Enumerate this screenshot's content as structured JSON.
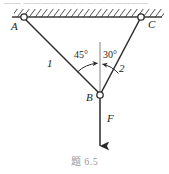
{
  "figure": {
    "caption": "题 6.5",
    "bleed_text": "一一 一一一一一一一一一一一一一一",
    "points": {
      "a_label": "A",
      "b_label": "B",
      "c_label": "C"
    },
    "rods": {
      "rod1_label": "1",
      "rod2_label": "2"
    },
    "angles": {
      "left_label": "45°",
      "right_label": "30°"
    },
    "force": {
      "label": "F"
    },
    "colors": {
      "line": "#2a2a2a",
      "ceiling": "#3a3a3a",
      "reference_line": "#8d8d8d",
      "arc": "#3a3a3a",
      "text": "#1c1c1c",
      "caption_text": "#9a9a9a",
      "background": "#ffffff"
    },
    "geometry": {
      "ceiling_y": 17,
      "ceiling_x1": 12,
      "ceiling_x2": 162,
      "a_x": 24,
      "a_y": 17,
      "c_x": 141,
      "c_y": 17,
      "b_x": 100,
      "b_y": 95,
      "force_tip_y": 148,
      "vertical_ref_top": 42
    }
  }
}
